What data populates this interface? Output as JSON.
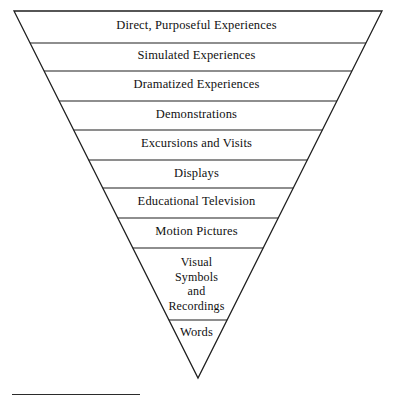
{
  "diagram": {
    "type": "inverted-triangle-cone",
    "title_visible": false,
    "shape": {
      "top_left": [
        14,
        11
      ],
      "top_right": [
        382,
        11
      ],
      "apex": [
        198,
        378
      ]
    },
    "stroke_color": "#1f1f1f",
    "fill_color": "#ffffff",
    "text_color": "#111111",
    "bands": [
      {
        "label": "Direct, Purposeful Experiences",
        "divider_y": 43,
        "text_y": 19
      },
      {
        "label": "Simulated Experiences",
        "divider_y": 71,
        "text_y": 49
      },
      {
        "label": "Dramatized Experiences",
        "divider_y": 101,
        "text_y": 78
      },
      {
        "label": "Demonstrations",
        "divider_y": 130,
        "text_y": 108
      },
      {
        "label": "Excursions and Visits",
        "divider_y": 160,
        "text_y": 137
      },
      {
        "label": "Displays",
        "divider_y": 188,
        "text_y": 167
      },
      {
        "label": "Educational Television",
        "divider_y": 218,
        "text_y": 195
      },
      {
        "label": "Motion Pictures",
        "divider_y": 248,
        "text_y": 225
      },
      {
        "label": "Visual\nSymbols\nand\nRecordings",
        "divider_y": 320,
        "text_y": 255,
        "multiline": true
      },
      {
        "label": "Words",
        "divider_y": null,
        "text_y": 326
      }
    ],
    "footer_rule": {
      "x": 12,
      "y": 394,
      "width": 128,
      "color": "#2b2b2b"
    }
  }
}
